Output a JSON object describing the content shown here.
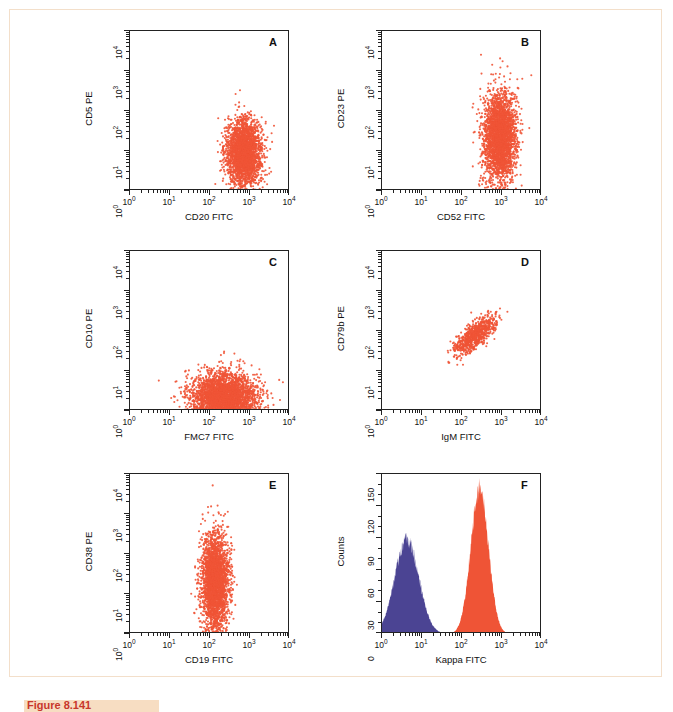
{
  "figure": {
    "caption": "Figure 8.141",
    "frame_color": "#f3dfca",
    "dot_color": "#ef5436",
    "hist_orange_color": "#ef5436",
    "hist_blue_color": "#4b4493"
  },
  "axis": {
    "log_ticks": [
      "10⁰",
      "10¹",
      "10²",
      "10³",
      "10⁴"
    ],
    "log_tick_exponents": [
      "0",
      "1",
      "2",
      "3",
      "4"
    ],
    "log_tick_base": "10",
    "counts_ticks": [
      "0",
      "30",
      "60",
      "90",
      "120",
      "150"
    ]
  },
  "panels": [
    {
      "letter": "A",
      "xlabel": "CD20 FITC",
      "ylabel": "CD5 PE",
      "type": "scatter"
    },
    {
      "letter": "B",
      "xlabel": "CD52 FITC",
      "ylabel": "CD23 PE",
      "type": "scatter"
    },
    {
      "letter": "C",
      "xlabel": "FMC7 FITC",
      "ylabel": "CD10 PE",
      "type": "scatter"
    },
    {
      "letter": "D",
      "xlabel": "IgM FITC",
      "ylabel": "CD79b PE",
      "type": "scatter"
    },
    {
      "letter": "E",
      "xlabel": "CD19 FITC",
      "ylabel": "CD38 PE",
      "type": "scatter"
    },
    {
      "letter": "F",
      "xlabel": "Kappa FITC",
      "ylabel": "Counts",
      "type": "histogram"
    }
  ],
  "chart_data": [
    {
      "type": "scatter",
      "panel": "A",
      "title": "A",
      "xlabel": "CD20 FITC",
      "ylabel": "CD5 PE",
      "xscale": "log",
      "yscale": "log",
      "xlim": [
        1,
        10000
      ],
      "ylim": [
        1,
        10000
      ],
      "xticks": [
        1,
        10,
        100,
        1000,
        10000
      ],
      "yticks": [
        1,
        10,
        100,
        1000,
        10000
      ],
      "grid": false,
      "n_events": 2600,
      "cluster": {
        "x_center_log10": 2.85,
        "y_center_log10": 0.95,
        "x_sd_log10": 0.22,
        "y_sd_log10": 0.42,
        "description": "single dense population, CD20 bright, CD5 dim-positive, squashed on lower axis"
      }
    },
    {
      "type": "scatter",
      "panel": "B",
      "title": "B",
      "xlabel": "CD52 FITC",
      "ylabel": "CD23 PE",
      "xscale": "log",
      "yscale": "log",
      "xlim": [
        1,
        10000
      ],
      "ylim": [
        1,
        10000
      ],
      "xticks": [
        1,
        10,
        100,
        1000,
        10000
      ],
      "yticks": [
        1,
        10,
        100,
        1000,
        10000
      ],
      "grid": false,
      "n_events": 2800,
      "cluster": {
        "x_center_log10": 2.95,
        "y_center_log10": 1.35,
        "x_sd_log10": 0.2,
        "y_sd_log10": 0.55,
        "description": "vertically elongated population, CD52 bright, CD23 positive spread 10^0 to 10^2.3"
      }
    },
    {
      "type": "scatter",
      "panel": "C",
      "title": "C",
      "xlabel": "FMC7 FITC",
      "ylabel": "CD10 PE",
      "xscale": "log",
      "yscale": "log",
      "xlim": [
        1,
        10000
      ],
      "ylim": [
        1,
        10000
      ],
      "xticks": [
        1,
        10,
        100,
        1000,
        10000
      ],
      "yticks": [
        1,
        10,
        100,
        1000,
        10000
      ],
      "grid": false,
      "n_events": 3000,
      "cluster": {
        "x_center_log10": 2.35,
        "y_center_log10": 0.35,
        "x_sd_log10": 0.4,
        "y_sd_log10": 0.3,
        "description": "broad horizontal band hugging baseline, CD10 negative, FMC7 dim/negative"
      }
    },
    {
      "type": "scatter",
      "panel": "D",
      "title": "D",
      "xlabel": "IgM FITC",
      "ylabel": "CD79b PE",
      "xscale": "log",
      "yscale": "log",
      "xlim": [
        1,
        10000
      ],
      "ylim": [
        1,
        10000
      ],
      "xticks": [
        1,
        10,
        100,
        1000,
        10000
      ],
      "yticks": [
        1,
        10,
        100,
        1000,
        10000
      ],
      "grid": false,
      "n_events": 800,
      "cluster": {
        "x_center_log10": 2.35,
        "y_center_log10": 1.9,
        "x_sd_log10": 0.26,
        "y_sd_log10": 0.24,
        "correlation": 0.75,
        "description": "diagonal correlated population, IgM and CD79b both positive"
      }
    },
    {
      "type": "scatter",
      "panel": "E",
      "title": "E",
      "xlabel": "CD19 FITC",
      "ylabel": "CD38 PE",
      "xscale": "log",
      "yscale": "log",
      "xlim": [
        1,
        10000
      ],
      "ylim": [
        1,
        10000
      ],
      "xticks": [
        1,
        10,
        100,
        1000,
        10000
      ],
      "yticks": [
        1,
        10,
        100,
        1000,
        10000
      ],
      "grid": false,
      "n_events": 2800,
      "cluster": {
        "x_center_log10": 2.12,
        "y_center_log10": 1.3,
        "x_sd_log10": 0.17,
        "y_sd_log10": 0.6,
        "description": "narrow vertical column at CD19 ~10^2, CD38 spread from baseline to 10^2.3"
      }
    },
    {
      "type": "histogram",
      "panel": "F",
      "title": "F",
      "xlabel": "Kappa FITC",
      "ylabel": "Counts",
      "xscale": "log",
      "yscale": "linear",
      "xlim": [
        1,
        10000
      ],
      "ylim": [
        0,
        150
      ],
      "xticks": [
        1,
        10,
        100,
        1000,
        10000
      ],
      "yticks": [
        0,
        30,
        60,
        90,
        120,
        150
      ],
      "grid": false,
      "series": [
        {
          "name": "negative control (blue)",
          "color": "#4b4493",
          "peak_x": 4,
          "peak_count": 88,
          "x_start": 1,
          "x_end": 48,
          "mean_log10": 0.62,
          "sd_log10": 0.3
        },
        {
          "name": "Kappa positive (orange)",
          "color": "#ef5436",
          "peak_x": 280,
          "peak_count": 137,
          "x_start": 48,
          "x_end": 4000,
          "mean_log10": 2.44,
          "sd_log10": 0.22
        }
      ]
    }
  ]
}
